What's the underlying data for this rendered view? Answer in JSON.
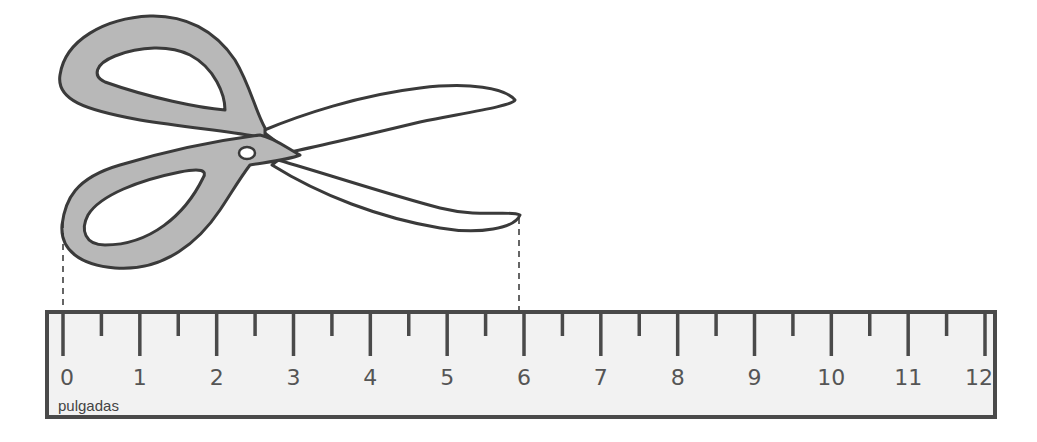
{
  "diagram": {
    "object": "scissors",
    "ruler": {
      "unit_label": "pulgadas",
      "labels": [
        "0",
        "1",
        "2",
        "3",
        "4",
        "5",
        "6",
        "7",
        "8",
        "9",
        "10",
        "11",
        "12"
      ],
      "min": 0,
      "max": 12,
      "minor_ticks": "half-inch"
    },
    "measurement": {
      "start": 0,
      "end": 6
    },
    "colors": {
      "outline": "#3a3a3a",
      "handle_fill": "#b8b8b8",
      "ruler_fill": "#f2f2f2",
      "ruler_border": "#4a4a4a",
      "text": "#555555"
    }
  }
}
